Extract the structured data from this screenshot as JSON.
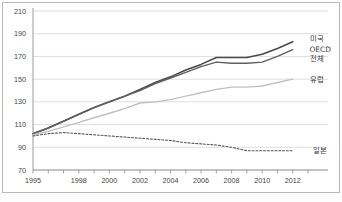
{
  "chart_data": {
    "type": "line",
    "title": "",
    "xlabel": "",
    "ylabel": "",
    "xlim": [
      1995,
      2013
    ],
    "ylim": [
      70,
      210
    ],
    "ytick_values": [
      70,
      90,
      110,
      130,
      150,
      170,
      190,
      210
    ],
    "ytick_labels": [
      "70",
      "90",
      "110",
      "130",
      "150",
      "170",
      "190",
      "210"
    ],
    "xtick_values": [
      1995,
      1998,
      2000,
      2002,
      2004,
      2006,
      2008,
      2010,
      2012
    ],
    "xtick_labels": [
      "1995",
      "1998",
      "2000",
      "2002",
      "2004",
      "2006",
      "2008",
      "2010",
      "2012"
    ],
    "grid": "horizontal",
    "legend_position": "right-inline",
    "x": [
      1995,
      1996,
      1997,
      1998,
      1999,
      2000,
      2001,
      2002,
      2003,
      2004,
      2005,
      2006,
      2007,
      2008,
      2009,
      2010,
      2011,
      2012
    ],
    "series": [
      {
        "name": "미국",
        "label": "미국",
        "color": "#4a4a4a",
        "style": "solid",
        "width": 1.6,
        "label_x": 2013.1,
        "label_y": 186,
        "values": [
          102,
          107,
          113,
          119,
          125,
          130,
          135,
          141,
          147,
          152,
          158,
          163,
          169,
          169,
          169,
          172,
          177,
          183
        ]
      },
      {
        "name": "OECD 전체",
        "label": "OECD",
        "label2": "전체",
        "color": "#5f5f5f",
        "style": "solid",
        "width": 1.4,
        "label_x": 2013.1,
        "label_y": 176,
        "values": [
          102,
          107,
          113,
          119,
          125,
          130,
          135,
          140,
          146,
          151,
          156,
          161,
          165,
          164,
          164,
          165,
          170,
          176
        ]
      },
      {
        "name": "유럽",
        "label": "유럽",
        "color": "#c0c0c0",
        "style": "solid",
        "width": 1.4,
        "label_x": 2013.1,
        "label_y": 150,
        "values": [
          101,
          104,
          108,
          112,
          116,
          120,
          124,
          129,
          130,
          132,
          135,
          138,
          141,
          143,
          143,
          144,
          147,
          150
        ]
      },
      {
        "name": "일본",
        "label": "일본",
        "color": "#555555",
        "style": "dashed",
        "width": 1.1,
        "label_x": 2013.3,
        "label_y": 87,
        "values": [
          100,
          102,
          103,
          102,
          101,
          100,
          99,
          98,
          97,
          96,
          94,
          93,
          92,
          90,
          87,
          87,
          87,
          87
        ]
      }
    ]
  }
}
